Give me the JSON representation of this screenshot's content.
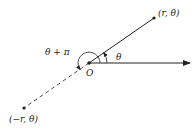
{
  "diagram": {
    "labels": {
      "point_positive": "(r, θ)",
      "point_negative": "(−r, θ)",
      "origin": "O",
      "angle_theta": "θ",
      "angle_theta_plus_pi": "θ + π"
    },
    "colors": {
      "stroke": "#222222",
      "background": "#ffffff"
    }
  }
}
